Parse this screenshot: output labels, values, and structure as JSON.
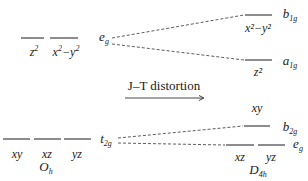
{
  "diagram": {
    "colors": {
      "line": "#1a1a1a",
      "dashed": "#333333",
      "background": "#ffffff"
    },
    "process": {
      "label": "J–T distortion",
      "arrow": "right-arrow"
    },
    "left_group": {
      "symmetry": "O",
      "symmetry_sub": "h",
      "eg_set": {
        "label": "e",
        "label_sub": "g",
        "orbitals": [
          {
            "name": "z",
            "sup": "2",
            "rest": ""
          },
          {
            "name": "x",
            "sup": "2",
            "rest": "−y",
            "rest_sup": "2"
          }
        ]
      },
      "t2g_set": {
        "label": "t",
        "label_sub": "2g",
        "orbitals": [
          "xy",
          "xz",
          "yz"
        ]
      }
    },
    "right_group": {
      "symmetry": "D",
      "symmetry_sub": "4h",
      "levels": [
        {
          "label": "b",
          "label_sub": "1g",
          "orbital": "x²−y²"
        },
        {
          "label": "a",
          "label_sub": "1g",
          "orbital": "z²"
        },
        {
          "label": "b",
          "label_sub": "2g",
          "orbital": "xy"
        },
        {
          "label": "e",
          "label_sub": "g",
          "orbitals": [
            "xz",
            "yz"
          ]
        }
      ]
    }
  }
}
